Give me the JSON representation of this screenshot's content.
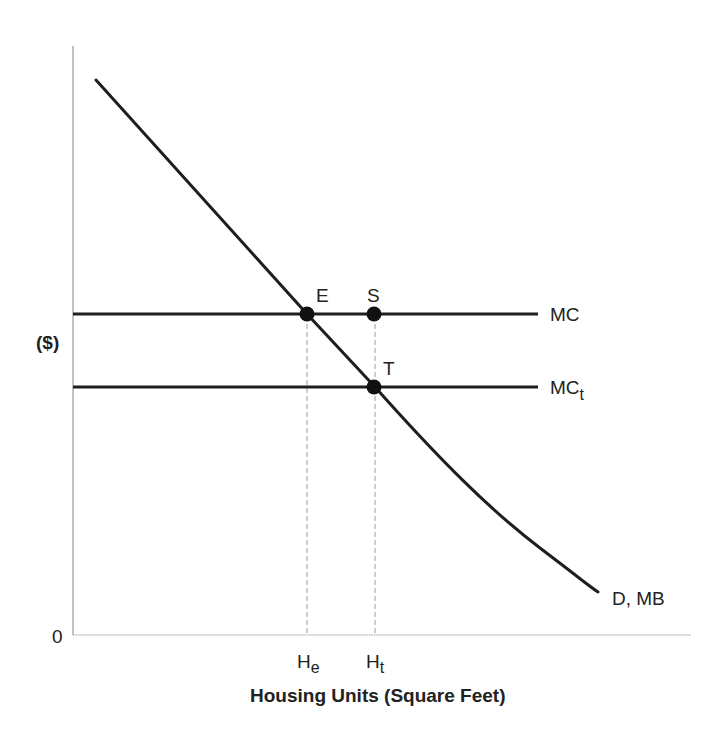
{
  "diagram": {
    "type": "supply-demand",
    "axes": {
      "y_label": "($)",
      "x_label": "Housing Units (Square Feet)",
      "origin_label": "0"
    },
    "curves": {
      "demand": {
        "label": "D, MB"
      },
      "mc": {
        "label": "MC"
      },
      "mc_t": {
        "label_main": "MC",
        "label_sub": "t"
      }
    },
    "points": {
      "e": {
        "label": "E"
      },
      "s": {
        "label": "S"
      },
      "t": {
        "label": "T"
      }
    },
    "x_ticks": {
      "he": {
        "main": "H",
        "sub": "e"
      },
      "ht": {
        "main": "H",
        "sub": "t"
      }
    },
    "colors": {
      "curve": "#1e1e1e",
      "axis": "#9a9a9a",
      "dashed": "#9a9a9a",
      "text": "#222222"
    }
  }
}
